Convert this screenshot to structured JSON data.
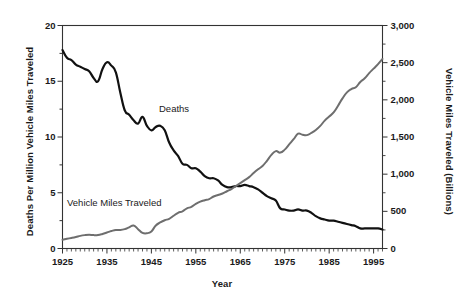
{
  "chart_data": {
    "type": "line",
    "title": "",
    "xlabel": "Year",
    "ylabel": "Deaths Per Million Vehicle Miles Traveled",
    "y2label": "Vehicle Miles Traveled (Billions)",
    "xlim": [
      1925,
      1997
    ],
    "ylim": [
      0,
      20
    ],
    "y2lim": [
      0,
      3000
    ],
    "grid": false,
    "legend_position": "inline-annotations",
    "x_ticks": [
      1925,
      1935,
      1945,
      1955,
      1965,
      1975,
      1985,
      1995
    ],
    "x_tick_labels": [
      "1925",
      "1935",
      "1945",
      "1955",
      "1965",
      "1975",
      "1985",
      "1995"
    ],
    "x_minor_tick_interval": 1,
    "y_ticks": [
      0,
      5,
      10,
      15,
      20
    ],
    "y_tick_labels": [
      "0",
      "5",
      "10",
      "15",
      "20"
    ],
    "y_minor_tick_interval": 2.5,
    "y2_ticks": [
      0,
      500,
      1000,
      1500,
      2000,
      2500,
      3000
    ],
    "y2_tick_labels": [
      "0",
      "500",
      "1,000",
      "1,500",
      "2,000",
      "2,500",
      "3,000"
    ],
    "series": [
      {
        "name": "Deaths",
        "axis": "left",
        "color": "#111111",
        "line_width": 2.2,
        "annotation": "Deaths",
        "x": [
          1925,
          1926,
          1927,
          1928,
          1929,
          1930,
          1931,
          1932,
          1933,
          1934,
          1935,
          1936,
          1937,
          1938,
          1939,
          1940,
          1941,
          1942,
          1943,
          1944,
          1945,
          1946,
          1947,
          1948,
          1949,
          1950,
          1951,
          1952,
          1953,
          1954,
          1955,
          1956,
          1957,
          1958,
          1959,
          1960,
          1961,
          1962,
          1963,
          1964,
          1965,
          1966,
          1967,
          1968,
          1969,
          1970,
          1971,
          1972,
          1973,
          1974,
          1975,
          1976,
          1977,
          1978,
          1979,
          1980,
          1981,
          1982,
          1983,
          1984,
          1985,
          1986,
          1987,
          1988,
          1989,
          1990,
          1991,
          1992,
          1993,
          1994,
          1995,
          1996,
          1997
        ],
        "y": [
          17.8,
          17.1,
          16.9,
          16.5,
          16.3,
          16.1,
          15.9,
          15.3,
          15.0,
          16.1,
          16.7,
          16.4,
          15.8,
          14.0,
          12.4,
          12.0,
          11.5,
          11.2,
          11.8,
          11.0,
          10.6,
          10.9,
          11.0,
          10.6,
          9.5,
          8.8,
          8.3,
          7.6,
          7.5,
          7.2,
          7.2,
          6.9,
          6.5,
          6.3,
          6.3,
          6.1,
          5.7,
          5.5,
          5.5,
          5.6,
          5.6,
          5.7,
          5.6,
          5.5,
          5.3,
          5.0,
          4.7,
          4.5,
          4.3,
          3.6,
          3.5,
          3.4,
          3.4,
          3.5,
          3.4,
          3.4,
          3.2,
          2.9,
          2.7,
          2.6,
          2.5,
          2.5,
          2.4,
          2.3,
          2.2,
          2.1,
          2.0,
          1.8,
          1.8,
          1.8,
          1.8,
          1.8,
          1.7
        ]
      },
      {
        "name": "Vehicle Miles Traveled",
        "axis": "right",
        "color": "#6e6e6e",
        "line_width": 2.0,
        "annotation": "Vehicle Miles Traveled",
        "x": [
          1925,
          1926,
          1927,
          1928,
          1929,
          1930,
          1931,
          1932,
          1933,
          1934,
          1935,
          1936,
          1937,
          1938,
          1939,
          1940,
          1941,
          1942,
          1943,
          1944,
          1945,
          1946,
          1947,
          1948,
          1949,
          1950,
          1951,
          1952,
          1953,
          1954,
          1955,
          1956,
          1957,
          1958,
          1959,
          1960,
          1961,
          1962,
          1963,
          1964,
          1965,
          1966,
          1967,
          1968,
          1969,
          1970,
          1971,
          1972,
          1973,
          1974,
          1975,
          1976,
          1977,
          1978,
          1979,
          1980,
          1981,
          1982,
          1983,
          1984,
          1985,
          1986,
          1987,
          1988,
          1989,
          1990,
          1991,
          1992,
          1993,
          1994,
          1995,
          1996,
          1997
        ],
        "y": [
          118,
          130,
          142,
          155,
          170,
          180,
          185,
          180,
          182,
          196,
          215,
          235,
          250,
          248,
          260,
          285,
          310,
          260,
          210,
          205,
          230,
          310,
          350,
          380,
          400,
          440,
          480,
          500,
          540,
          560,
          600,
          630,
          650,
          665,
          700,
          720,
          740,
          770,
          800,
          840,
          880,
          920,
          960,
          1015,
          1065,
          1110,
          1180,
          1260,
          1310,
          1290,
          1330,
          1400,
          1470,
          1545,
          1530,
          1525,
          1555,
          1595,
          1650,
          1720,
          1775,
          1830,
          1920,
          2020,
          2100,
          2145,
          2170,
          2240,
          2290,
          2360,
          2420,
          2480,
          2550
        ]
      }
    ],
    "annotations": [
      {
        "text": "Deaths",
        "x": 1953,
        "y": 12.0
      },
      {
        "text": "Vehicle Miles Traveled",
        "x": 1927,
        "y": 4.2
      }
    ]
  },
  "axes": {
    "frame_color": "#333333",
    "background": "#ffffff"
  }
}
